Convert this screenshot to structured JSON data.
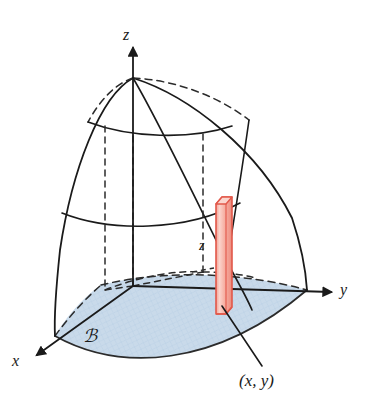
{
  "figure": {
    "background_color": "#ffffff",
    "width": 367,
    "height": 409
  },
  "axes": {
    "z": {
      "label": "z",
      "direction": "up",
      "arrow": true
    },
    "y": {
      "label": "y",
      "direction": "right",
      "arrow": true
    },
    "x": {
      "label": "x",
      "direction": "down-left",
      "arrow": true
    },
    "origin": {
      "x": 133,
      "y": 286
    },
    "color": "#1a1a1a"
  },
  "labels": {
    "region": "ℬ",
    "height": "z",
    "point": "(x, y)"
  },
  "colors": {
    "base_region_fill": "#c9daea",
    "base_region_stroke": "#3c3c3c",
    "column_fill": "#f7b0a4",
    "column_fill_light": "#fbd6ce",
    "column_stroke": "#e2584a",
    "curve_stroke": "#1a1a1a",
    "hidden_stroke": "#2b2b2b"
  },
  "geometry": {
    "dome_apex": {
      "x": 133,
      "y": 78
    },
    "dome_left_base": {
      "x": 55,
      "y": 336
    },
    "dome_right_base": {
      "x": 307,
      "y": 290
    },
    "column": {
      "x_left": 216,
      "x_right": 232,
      "y_top": 197,
      "y_bottom": 314,
      "height_label": "z"
    },
    "leader_line": {
      "from": {
        "x": 224,
        "y": 307
      },
      "to": {
        "x": 262,
        "y": 364
      }
    },
    "latitude_curves": 2,
    "meridian_curves": 2,
    "hidden_vertical_lines": 3
  }
}
